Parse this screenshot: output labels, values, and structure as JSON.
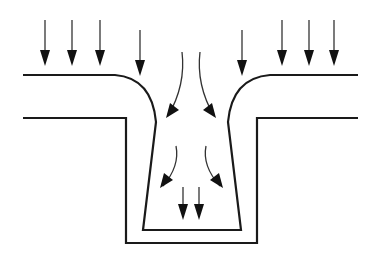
{
  "diagram": {
    "colors": {
      "line": "#1a1a1a",
      "arrow": "#111111",
      "background": "#ffffff"
    },
    "arrows": {
      "vertical_left": [
        {
          "x": 45,
          "y1": 20,
          "y2": 66
        },
        {
          "x": 72,
          "y1": 20,
          "y2": 66
        },
        {
          "x": 100,
          "y1": 20,
          "y2": 66
        },
        {
          "x": 140,
          "y1": 30,
          "y2": 76
        }
      ],
      "vertical_right": [
        {
          "x": 242,
          "y1": 30,
          "y2": 76
        },
        {
          "x": 282,
          "y1": 20,
          "y2": 66
        },
        {
          "x": 309,
          "y1": 20,
          "y2": 66
        },
        {
          "x": 334,
          "y1": 20,
          "y2": 66
        }
      ],
      "curved_upper": [
        {
          "path": "M182 52 Q186 85 168 116",
          "tip": [
            166,
            118
          ],
          "dir": "left"
        },
        {
          "path": "M200 52 Q196 85 214 116",
          "tip": [
            216,
            118
          ],
          "dir": "right"
        }
      ],
      "curved_lower": [
        {
          "path": "M176 146 Q180 166 163 186",
          "tip": [
            160,
            188
          ],
          "dir": "left"
        },
        {
          "path": "M206 146 Q202 166 220 186",
          "tip": [
            223,
            188
          ],
          "dir": "right"
        }
      ],
      "bottom_pair": [
        {
          "x": 183,
          "y1": 187,
          "y2": 220
        },
        {
          "x": 199,
          "y1": 187,
          "y2": 220
        }
      ]
    }
  }
}
